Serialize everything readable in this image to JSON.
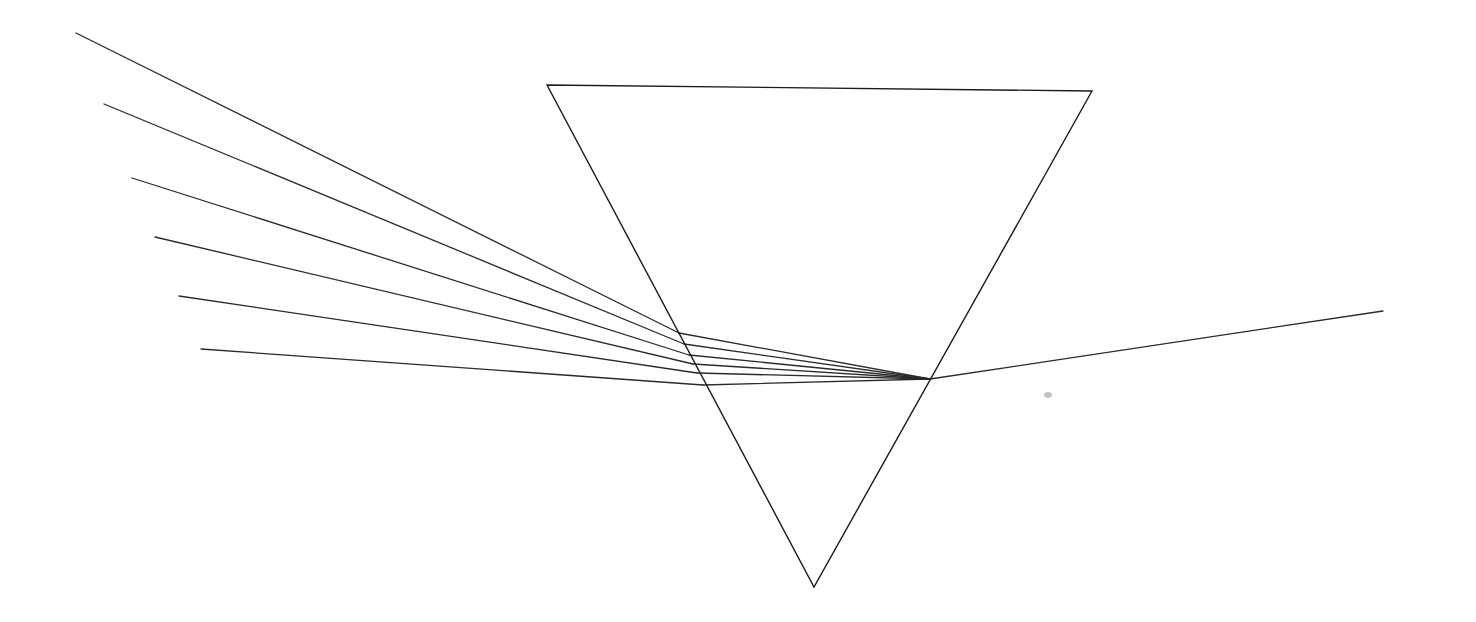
{
  "diagram": {
    "canvas": {
      "width": 1476,
      "height": 622,
      "background": "#ffffff"
    },
    "colors": {
      "prism": "#1a1a1a",
      "rays": "#2a2a2a",
      "smudge": "#c4c4c4"
    },
    "prism": {
      "vertices": [
        [
          547,
          85
        ],
        [
          1092,
          91
        ],
        [
          814,
          587
        ]
      ]
    },
    "incident_rays": [
      {
        "start": [
          76,
          33
        ],
        "entry": [
          679,
          333
        ]
      },
      {
        "start": [
          104,
          104
        ],
        "entry": [
          684,
          344
        ]
      },
      {
        "start": [
          132,
          178
        ],
        "entry": [
          689,
          355
        ]
      },
      {
        "start": [
          155,
          237
        ],
        "entry": [
          693,
          364
        ]
      },
      {
        "start": [
          179,
          296
        ],
        "entry": [
          697,
          373
        ]
      },
      {
        "start": [
          201,
          349
        ],
        "entry": [
          703,
          385
        ]
      }
    ],
    "convergence_point": [
      930,
      379
    ],
    "exit_ray": {
      "start": [
        930,
        379
      ],
      "end": [
        1383,
        311
      ]
    },
    "smudge": {
      "cx": 1048,
      "cy": 395,
      "rx": 4,
      "ry": 3
    }
  }
}
